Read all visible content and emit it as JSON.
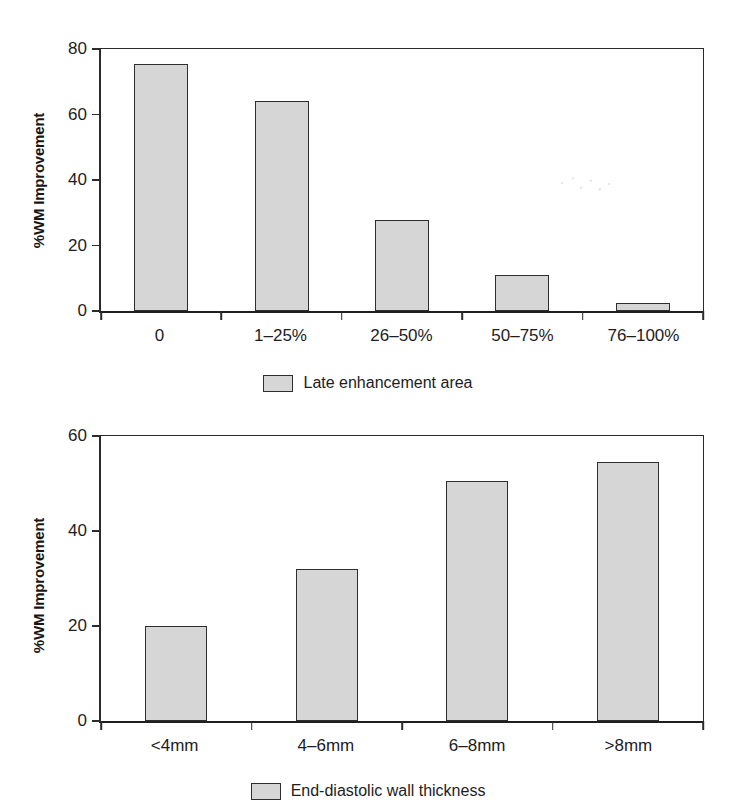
{
  "page": {
    "background_color": "#ffffff",
    "ink_color": "#1d1d1d",
    "bar_fill_color": "#d6d6d6",
    "bar_border_color": "#2e2e2e"
  },
  "chart_data": [
    {
      "type": "bar",
      "id": "late-enhancement-chart",
      "title": "",
      "xlabel": "",
      "ylabel": "%WM Improvement",
      "categories": [
        "0",
        "1–25%",
        "26–50%",
        "50–75%",
        "76–100%"
      ],
      "values": [
        75.5,
        64,
        27.8,
        11,
        2.5
      ],
      "ylim": [
        0,
        80
      ],
      "yticks": [
        0,
        20,
        40,
        60,
        80
      ],
      "ytick_labels": [
        "0",
        "20",
        "40",
        "60",
        "80"
      ],
      "grid": false,
      "legend_position": "bottom",
      "legend": [
        {
          "label": "Late enhancement area",
          "color": "#d6d6d6"
        }
      ]
    },
    {
      "type": "bar",
      "id": "wall-thickness-chart",
      "title": "",
      "xlabel": "",
      "ylabel": "%WM Improvement",
      "categories": [
        "<4mm",
        "4–6mm",
        "6–8mm",
        ">8mm"
      ],
      "values": [
        20,
        32,
        50.5,
        54.5
      ],
      "ylim": [
        0,
        60
      ],
      "yticks": [
        0,
        20,
        40,
        60
      ],
      "ytick_labels": [
        "0",
        "20",
        "40",
        "60"
      ],
      "grid": false,
      "legend_position": "bottom",
      "legend": [
        {
          "label": "End-diastolic wall thickness",
          "color": "#d6d6d6"
        }
      ]
    }
  ]
}
